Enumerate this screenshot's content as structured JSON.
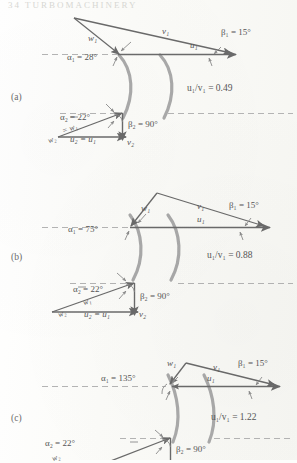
{
  "page": {
    "header": "34    TURBOMACHINERY",
    "panels": [
      {
        "id": "a",
        "label": "(a)",
        "ratio_label": "u₁/v₁ = 0.49",
        "inlet": {
          "alpha_label": "α₁ = 28°",
          "beta_label": "β₁ = 15°",
          "w_label": "w₁",
          "v_label": "v₁",
          "u_label": "u₁"
        },
        "outlet": {
          "alpha_label": "α₂ = 22°",
          "beta_label": "β₂ = 90°",
          "w_label": "w₂",
          "w_eq_label": "= w₁",
          "v_label": "v₂",
          "u_label": "u₂ = u₁"
        }
      },
      {
        "id": "b",
        "label": "(b)",
        "ratio_label": "u₁/v₁ = 0.88",
        "inlet": {
          "alpha_label": "α₁ = 75°",
          "beta_label": "β₁ = 15°",
          "w_label": "w₁",
          "v_label": "v₁",
          "u_label": "u₁"
        },
        "outlet": {
          "alpha_label": "α₂ = 22°",
          "beta_label": "β₂ = 90°",
          "w_label": "w₂",
          "w_eq_label": "w₁",
          "v_label": "v₂",
          "u_label": "u₂ = u₁"
        }
      },
      {
        "id": "c",
        "label": "(c)",
        "ratio_label": "u₁/v₁ = 1.22",
        "inlet": {
          "alpha_label": "α₁ = 135°",
          "beta_label": "β₁ = 15°",
          "w_label": "w₁",
          "v_label": "v₁",
          "u_label": "u₁"
        },
        "outlet": {
          "alpha_label": "α₂ = 22°",
          "beta_label": "β₂ = 90°",
          "w_label": "w₂",
          "v_label": "v₂",
          "u_label": "u₂ = u₁"
        }
      }
    ],
    "colors": {
      "ink": "#6a6a6a",
      "blade": "#a9a9a9",
      "dashed": "#b4b4b4",
      "paper": "#fdfdfb"
    }
  }
}
